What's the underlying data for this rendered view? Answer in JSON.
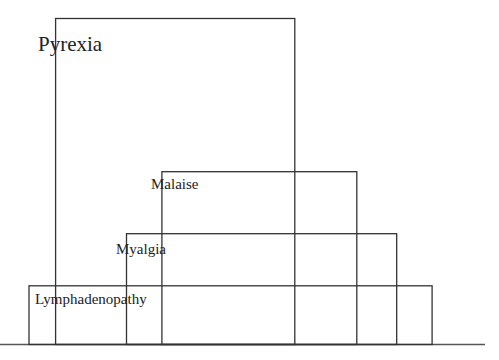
{
  "chart_data": {
    "type": "bar",
    "title": "",
    "xlabel": "",
    "ylabel": "",
    "grid": false,
    "legend": "none",
    "categories": [
      "Pyrexia",
      "Malaise",
      "Myalgia",
      "Lymphadenopathy"
    ],
    "series": [
      {
        "name": "span_start",
        "values": [
          0.06,
          0.3,
          0.22,
          0.0
        ]
      },
      {
        "name": "span_end",
        "values": [
          0.6,
          0.74,
          0.83,
          0.91
        ]
      },
      {
        "name": "height",
        "values": [
          1.0,
          0.53,
          0.34,
          0.18
        ]
      }
    ],
    "labels": {
      "pyrexia": "Pyrexia",
      "malaise": "Malaise",
      "myalgia": "Myalgia",
      "lymphadenopathy": "Lymphadenopathy"
    }
  }
}
